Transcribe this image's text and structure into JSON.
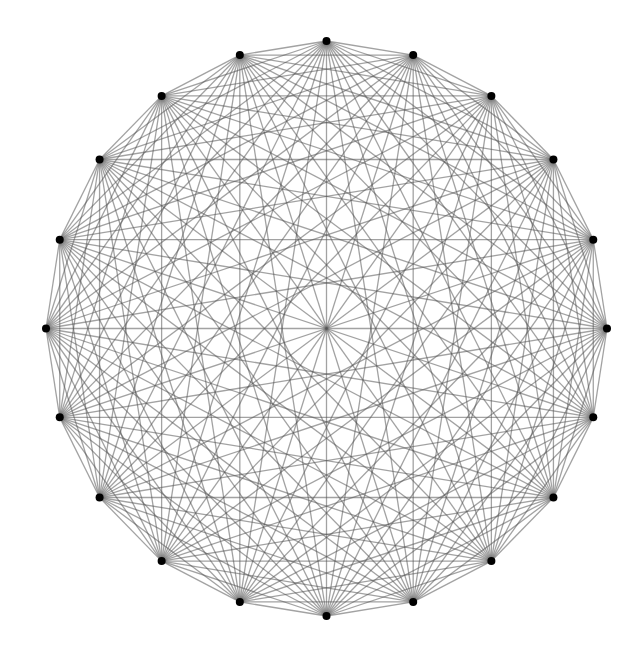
{
  "diagram": {
    "type": "complete-graph",
    "name": "K20",
    "vertex_count": 20,
    "layout": "circular",
    "center": [
      326.5,
      328.5
    ],
    "radius_x": 280.5,
    "radius_y": 287.5,
    "start_angle_deg": 90,
    "vertices": [
      [
        330,
        41
      ],
      [
        416,
        55
      ],
      [
        494,
        97
      ],
      [
        554,
        160
      ],
      [
        594,
        241
      ],
      [
        607,
        330
      ],
      [
        592,
        418
      ],
      [
        551,
        498
      ],
      [
        489,
        562
      ],
      [
        411,
        601
      ],
      [
        325,
        616
      ],
      [
        238,
        601
      ],
      [
        159,
        559
      ],
      [
        98,
        494
      ],
      [
        59,
        415
      ],
      [
        46,
        326
      ],
      [
        61,
        237
      ],
      [
        101,
        157
      ],
      [
        163,
        96
      ],
      [
        243,
        53
      ]
    ],
    "edge_color": "#555555",
    "edge_opacity": 0.55,
    "node_color": "#000000",
    "node_radius": 4,
    "background": "#ffffff"
  }
}
